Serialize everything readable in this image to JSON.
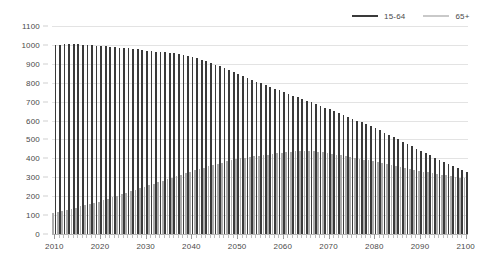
{
  "chart": {
    "type": "bar",
    "title": "",
    "legend_position": "top-right"
  },
  "legend": {
    "items": [
      {
        "label": "15-64",
        "color": "#3a3a3a"
      },
      {
        "label": "65+",
        "color": "#adadad"
      }
    ]
  },
  "axes": {
    "y": {
      "label": "",
      "min": 0,
      "max": 1100,
      "step": 100,
      "ticks": [
        "0",
        "100",
        "200",
        "300",
        "400",
        "500",
        "600",
        "700",
        "800",
        "900",
        "1000",
        "1100"
      ]
    },
    "x": {
      "label": "",
      "min": 2010,
      "max": 2100,
      "tick_step": 1,
      "label_step": 10,
      "labels": [
        "2010",
        "2020",
        "2030",
        "2040",
        "2050",
        "2060",
        "2070",
        "2080",
        "2090",
        "2100"
      ]
    }
  },
  "chart_data": {
    "type": "bar",
    "title": "",
    "xlabel": "",
    "ylabel": "",
    "ylim": [
      0,
      1100
    ],
    "xlim": [
      2010,
      2100
    ],
    "grid": true,
    "legend_position": "top-right",
    "categories": [
      "2010",
      "2011",
      "2012",
      "2013",
      "2014",
      "2015",
      "2016",
      "2017",
      "2018",
      "2019",
      "2020",
      "2021",
      "2022",
      "2023",
      "2024",
      "2025",
      "2026",
      "2027",
      "2028",
      "2029",
      "2030",
      "2031",
      "2032",
      "2033",
      "2034",
      "2035",
      "2036",
      "2037",
      "2038",
      "2039",
      "2040",
      "2041",
      "2042",
      "2043",
      "2044",
      "2045",
      "2046",
      "2047",
      "2048",
      "2049",
      "2050",
      "2051",
      "2052",
      "2053",
      "2054",
      "2055",
      "2056",
      "2057",
      "2058",
      "2059",
      "2060",
      "2061",
      "2062",
      "2063",
      "2064",
      "2065",
      "2066",
      "2067",
      "2068",
      "2069",
      "2070",
      "2071",
      "2072",
      "2073",
      "2074",
      "2075",
      "2076",
      "2077",
      "2078",
      "2079",
      "2080",
      "2081",
      "2082",
      "2083",
      "2084",
      "2085",
      "2086",
      "2087",
      "2088",
      "2089",
      "2090",
      "2091",
      "2092",
      "2093",
      "2094",
      "2095",
      "2096",
      "2097",
      "2098",
      "2099",
      "2100"
    ],
    "series": [
      {
        "name": "15-64",
        "color": "#3a3a3a",
        "values": [
          1000,
          1002,
          1004,
          1005,
          1005,
          1004,
          1002,
          1000,
          998,
          996,
          994,
          992,
          990,
          988,
          986,
          984,
          982,
          979,
          976,
          973,
          970,
          967,
          965,
          963,
          961,
          959,
          957,
          953,
          948,
          942,
          936,
          929,
          921,
          913,
          904,
          895,
          886,
          876,
          866,
          856,
          846,
          836,
          826,
          816,
          806,
          796,
          786,
          777,
          768,
          759,
          750,
          741,
          732,
          723,
          714,
          705,
          696,
          687,
          678,
          669,
          660,
          650,
          640,
          630,
          620,
          610,
          600,
          590,
          580,
          570,
          560,
          548,
          536,
          524,
          512,
          500,
          488,
          476,
          464,
          452,
          440,
          428,
          416,
          404,
          392,
          380,
          370,
          360,
          350,
          340,
          330
        ]
      },
      {
        "name": "65+",
        "color": "#adadad",
        "values": [
          110,
          116,
          122,
          128,
          134,
          140,
          146,
          152,
          158,
          164,
          170,
          178,
          186,
          194,
          202,
          210,
          218,
          226,
          234,
          242,
          250,
          258,
          266,
          274,
          282,
          290,
          298,
          306,
          314,
          322,
          330,
          337,
          344,
          351,
          358,
          365,
          372,
          378,
          384,
          390,
          395,
          400,
          404,
          408,
          411,
          414,
          417,
          420,
          423,
          426,
          430,
          433,
          436,
          438,
          440,
          440,
          439,
          437,
          435,
          432,
          428,
          424,
          420,
          416,
          412,
          408,
          404,
          399,
          394,
          389,
          384,
          379,
          374,
          369,
          364,
          359,
          354,
          349,
          344,
          339,
          334,
          330,
          326,
          322,
          318,
          314,
          310,
          306,
          302,
          298,
          295
        ]
      }
    ]
  }
}
